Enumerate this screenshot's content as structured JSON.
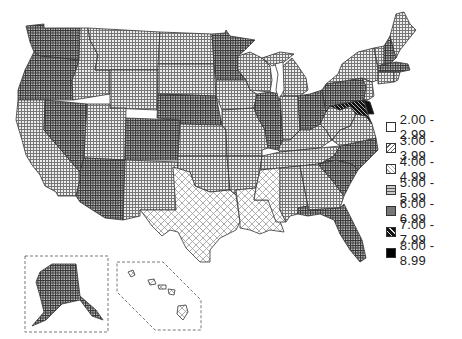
{
  "map": {
    "type": "choropleth",
    "region": "United States",
    "insets": [
      "Alaska",
      "Hawaii"
    ]
  },
  "legend": {
    "items": [
      {
        "label": "2.00 - 2.99",
        "pattern": "empty"
      },
      {
        "label": "3.00 - 3.99",
        "pattern": "diagonal-hatch"
      },
      {
        "label": "4.00 - 4.99",
        "pattern": "light-crosshatch"
      },
      {
        "label": "5.00 - 5.99",
        "pattern": "light-grid"
      },
      {
        "label": "6.00 - 6.99",
        "pattern": "dense-grid"
      },
      {
        "label": "7.00 - 7.99",
        "pattern": "dark-diagonal"
      },
      {
        "label": "8.00 - 8.99",
        "pattern": "solid-black"
      }
    ]
  },
  "states": {
    "4.00-4.99": [
      "TX",
      "LA",
      "MS"
    ],
    "6.00-6.99": [
      "WA",
      "OR",
      "NV",
      "AZ",
      "CO",
      "NE",
      "MN",
      "IL",
      "OH",
      "PA",
      "NC",
      "SC",
      "FL",
      "NH",
      "MA",
      "AK"
    ],
    "7.00-7.99": [
      "MD"
    ],
    "8.00-8.99": [
      "DC",
      "DE"
    ],
    "5.00-5.99": [
      "CA",
      "ID",
      "MT",
      "WY",
      "UT",
      "NM",
      "ND",
      "SD",
      "KS",
      "OK",
      "IA",
      "MO",
      "AR",
      "WI",
      "MI",
      "IN",
      "KY",
      "TN",
      "AL",
      "GA",
      "WV",
      "VA",
      "NY",
      "VT",
      "ME",
      "CT",
      "RI",
      "NJ"
    ],
    "no-fill": [
      "HI"
    ]
  }
}
